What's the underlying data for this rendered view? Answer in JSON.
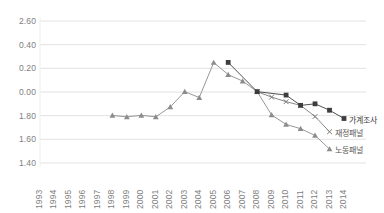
{
  "chart": {
    "title": "",
    "type": "line"
  },
  "chart_data": {
    "type": "line",
    "title": "",
    "subtitle": "",
    "xlabel": "",
    "ylabel": "",
    "grid": true,
    "legend_position": "right-inline-labels",
    "x": [
      1993,
      1994,
      1995,
      1996,
      1997,
      1998,
      1999,
      2000,
      2001,
      2002,
      2003,
      2004,
      2005,
      2006,
      2007,
      2008,
      2009,
      2010,
      2011,
      2012,
      2013,
      2014
    ],
    "xtick_labels": [
      "1993",
      "1994",
      "1995",
      "1996",
      "1997",
      "1998",
      "1999",
      "2000",
      "2001",
      "2002",
      "2003",
      "2004",
      "2005",
      "2006",
      "2007",
      "2008",
      "2009",
      "2010",
      "2011",
      "2012",
      "2013",
      "2014"
    ],
    "ytick_labels": [
      "2.60",
      "0.40",
      "0.20",
      "0.00",
      "1.80",
      "1.60",
      "1.40"
    ],
    "ytick_values": [
      2.6,
      2.4,
      2.2,
      2.0,
      1.8,
      1.6,
      1.4
    ],
    "ylim": [
      1.4,
      2.6
    ],
    "series": [
      {
        "name": "노동패널",
        "marker": "triangle",
        "color": "#8c8c8c",
        "label_color": "#585858",
        "points": [
          {
            "x": 1998,
            "y": 1.802
          },
          {
            "x": 1999,
            "y": 1.79
          },
          {
            "x": 2000,
            "y": 1.803
          },
          {
            "x": 2001,
            "y": 1.79
          },
          {
            "x": 2002,
            "y": 1.874
          },
          {
            "x": 2003,
            "y": 2.003
          },
          {
            "x": 2004,
            "y": 1.953
          },
          {
            "x": 2005,
            "y": 2.249
          },
          {
            "x": 2006,
            "y": 2.147
          },
          {
            "x": 2007,
            "y": 2.092
          },
          {
            "x": 2008,
            "y": 2.003
          },
          {
            "x": 2009,
            "y": 1.806
          },
          {
            "x": 2010,
            "y": 1.726
          },
          {
            "x": 2011,
            "y": 1.69
          },
          {
            "x": 2012,
            "y": 1.633
          },
          {
            "x": 2013,
            "y": 1.518
          }
        ]
      },
      {
        "name": "재정패널",
        "marker": "x",
        "color": "#7a7a7a",
        "label_color": "#585858",
        "points": [
          {
            "x": 2008,
            "y": 2.003
          },
          {
            "x": 2009,
            "y": 1.957
          },
          {
            "x": 2010,
            "y": 1.918
          },
          {
            "x": 2011,
            "y": 1.887
          },
          {
            "x": 2012,
            "y": 1.793
          },
          {
            "x": 2013,
            "y": 1.664
          }
        ]
      },
      {
        "name": "가계조사",
        "marker": "square",
        "color": "#3d3d3d",
        "label_color": "#404040",
        "points": [
          {
            "x": 2006,
            "y": 2.25
          },
          {
            "x": 2008,
            "y": 2.003
          },
          {
            "x": 2010,
            "y": 1.974
          },
          {
            "x": 2011,
            "y": 1.887
          },
          {
            "x": 2012,
            "y": 1.9
          },
          {
            "x": 2013,
            "y": 1.846
          },
          {
            "x": 2014,
            "y": 1.776
          }
        ]
      }
    ]
  }
}
